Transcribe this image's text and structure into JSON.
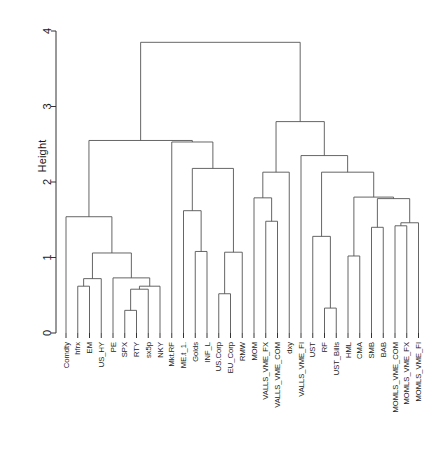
{
  "chart_data": {
    "type": "dendrogram",
    "title": "",
    "subtitle": "",
    "xlabel": "",
    "ylabel": "Height",
    "ylim": [
      0,
      4
    ],
    "y_ticks": [
      0,
      1,
      2,
      3,
      4
    ],
    "y_tick_labels": [
      "0",
      "1",
      "2",
      "3",
      "4"
    ],
    "grid": false,
    "legend": "none",
    "orientation": "vertical",
    "leaf_label_rotation": 90,
    "n_leaves": 29,
    "leaf_labels": [
      "Comdty",
      "hfrx",
      "EM",
      "US_HY",
      "PE",
      "SPX",
      "RTY",
      "sx5p",
      "NKY",
      "Mkt.RF",
      "ME.t_1.",
      "Golds",
      "INF_L",
      "US.Corp",
      "EU_Corp",
      "RMW",
      "MOM",
      "VALLS_VME_FX",
      "VALLS_VME_COM",
      "dxy",
      "VALLS_VME_FI",
      "UST",
      "RF",
      "UST_Bills",
      "HML",
      "CMA",
      "SMB",
      "BAB",
      "MOMLS_VME_COM",
      "MOMLS_VME_FX",
      "MOMLS_VME_FI"
    ],
    "merges": [
      {
        "id": "m1",
        "left": "hfrx",
        "right": "EM",
        "height": 0.62
      },
      {
        "id": "m2",
        "left": "m1",
        "right": "US_HY",
        "height": 0.72
      },
      {
        "id": "m3",
        "left": "SPX",
        "right": "RTY",
        "height": 0.3
      },
      {
        "id": "m4",
        "left": "m3",
        "right": "sx5p",
        "height": 0.58
      },
      {
        "id": "m5",
        "left": "m4",
        "right": "NKY",
        "height": 0.62
      },
      {
        "id": "m6",
        "left": "PE",
        "right": "m5",
        "height": 0.73
      },
      {
        "id": "m7",
        "left": "m2",
        "right": "m6",
        "height": 1.06
      },
      {
        "id": "m8",
        "left": "Comdty",
        "right": "m7",
        "height": 1.54
      },
      {
        "id": "m9",
        "left": "Golds",
        "right": "INF_L",
        "height": 1.08
      },
      {
        "id": "m10",
        "left": "ME.t_1.",
        "right": "m9",
        "height": 1.62
      },
      {
        "id": "m11",
        "left": "US.Corp",
        "right": "EU_Corp",
        "height": 0.52
      },
      {
        "id": "m12",
        "left": "m11",
        "right": "RMW",
        "height": 1.07
      },
      {
        "id": "m13",
        "left": "m10",
        "right": "m12",
        "height": 2.18
      },
      {
        "id": "m14",
        "left": "Mkt.RF",
        "right": "m13",
        "height": 2.53
      },
      {
        "id": "m15",
        "left": "m8",
        "right": "m14",
        "height": 2.55
      },
      {
        "id": "m16",
        "left": "VALLS_VME_FX",
        "right": "VALLS_VME_COM",
        "height": 1.48
      },
      {
        "id": "m17",
        "left": "MOM",
        "right": "m16",
        "height": 1.79
      },
      {
        "id": "m18",
        "left": "m17",
        "right": "dxy",
        "height": 2.13
      },
      {
        "id": "m19",
        "left": "RF",
        "right": "UST_Bills",
        "height": 0.33
      },
      {
        "id": "m20",
        "left": "UST",
        "right": "m19",
        "height": 1.28
      },
      {
        "id": "m21",
        "left": "HML",
        "right": "CMA",
        "height": 1.02
      },
      {
        "id": "m22",
        "left": "SMB",
        "right": "BAB",
        "height": 1.4
      },
      {
        "id": "m23",
        "left": "MOMLS_VME_COM",
        "right": "MOMLS_VME_FX",
        "height": 1.42
      },
      {
        "id": "m24",
        "left": "m23",
        "right": "MOMLS_VME_FI",
        "height": 1.46
      },
      {
        "id": "m25",
        "left": "m22",
        "right": "m24",
        "height": 1.78
      },
      {
        "id": "m26",
        "left": "m21",
        "right": "m25",
        "height": 1.8
      },
      {
        "id": "m27",
        "left": "m20",
        "right": "m26",
        "height": 2.13
      },
      {
        "id": "m28",
        "left": "VALLS_VME_FI",
        "right": "m27",
        "height": 2.35
      },
      {
        "id": "m29",
        "left": "m18",
        "right": "m28",
        "height": 2.8
      },
      {
        "id": "m30",
        "left": "m15",
        "right": "m29",
        "height": 3.85
      }
    ],
    "line_color": "#555555",
    "axis_color": "#333333",
    "text_color": "#1a1a1a",
    "background": "#ffffff"
  },
  "axis": {
    "y_title": "Height"
  }
}
